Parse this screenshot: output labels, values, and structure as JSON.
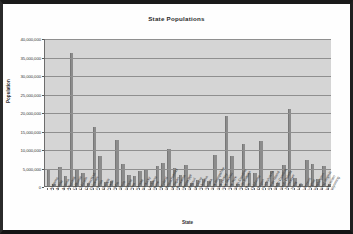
{
  "chart_data": {
    "type": "bar",
    "title": "State Populations",
    "xlabel": "State",
    "ylabel": "Population",
    "ylim": [
      0,
      40000000
    ],
    "ytick_step": 5000000,
    "ytick_labels": [
      "40,000,000",
      "35,000,000",
      "30,000,000",
      "25,000,000",
      "20,000,000",
      "15,000,000",
      "10,000,000",
      "5,000,000",
      "0"
    ],
    "ytick_values": [
      40000000,
      35000000,
      30000000,
      25000000,
      20000000,
      15000000,
      10000000,
      5000000,
      0
    ],
    "grid": true,
    "legend": "none",
    "bar_color": "#8c8c8c",
    "plot_background": "#d5d5d5",
    "categories": [
      "Alabama",
      "Alaska",
      "Arizona",
      "Arkansas",
      "California",
      "Colorado",
      "Connecticut",
      "Delaware",
      "Florida",
      "Georgia",
      "Hawaii",
      "Idaho",
      "Illinois",
      "Indiana",
      "Iowa",
      "Kansas",
      "Kentucky",
      "Louisiana",
      "Maine",
      "Maryland",
      "Massachusetts",
      "Michigan",
      "Minnesota",
      "Mississippi",
      "Missouri",
      "Montana",
      "Nebraska",
      "Nevada",
      "New Hampshire",
      "New Jersey",
      "New Mexico",
      "New York",
      "North Carolina",
      "North Dakota",
      "Ohio",
      "Oklahoma",
      "Oregon",
      "Pennsylvania",
      "Rhode Island",
      "South Carolina",
      "South Dakota",
      "Tennessee",
      "Texas",
      "Utah",
      "Vermont",
      "Virginia",
      "Washington",
      "West Virginia",
      "Wisconsin",
      "Wyoming"
    ],
    "values": [
      4447100,
      626932,
      5130632,
      2673400,
      36000000,
      4301261,
      3405565,
      783600,
      15982378,
      8186453,
      1211537,
      1293953,
      12419293,
      6080485,
      2926324,
      2688418,
      4041769,
      4468976,
      1274923,
      5296486,
      6349097,
      9938444,
      4919479,
      2844658,
      5595211,
      902195,
      1711263,
      1998257,
      1235786,
      8414350,
      1819046,
      18976457,
      8049313,
      642200,
      11353140,
      3450654,
      3421399,
      12281054,
      1048319,
      4012012,
      754844,
      5689283,
      20851820,
      2233169,
      608827,
      7078515,
      5894121,
      1808344,
      5363675,
      493782
    ]
  }
}
